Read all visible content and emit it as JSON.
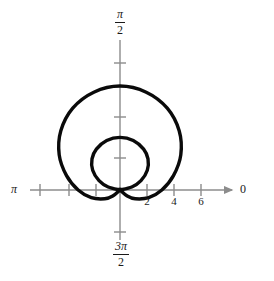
{
  "figure": {
    "title": "",
    "type": "polar-plot",
    "background_color": "#ffffff",
    "curve_color": "#0a0a0a",
    "axis_color": "#8c8c8c",
    "label_color": "#1a1a1a"
  },
  "labels": {
    "right_axis": "0",
    "left_axis": "π",
    "top_axis_numerator": "π",
    "top_axis_denominator": "2",
    "bottom_axis_numerator": "3π",
    "bottom_axis_denominator": "2"
  },
  "chart_data": {
    "type": "line",
    "title": "",
    "subtitle": "",
    "xlabel": "",
    "ylabel": "",
    "grid": false,
    "legend": null,
    "coordinate_system": "polar",
    "angle_axis_labels": [
      "0",
      "π/2",
      "π",
      "3π/2"
    ],
    "radial_tick_labels": [
      "2",
      "4",
      "6"
    ],
    "radial_tick_values": [
      2,
      4,
      6
    ],
    "xlim": [
      -6.6,
      7.4
    ],
    "ylim": [
      -5.2,
      7.4
    ],
    "origin_px": [
      120,
      190
    ],
    "pixels_per_unit": 13.5,
    "annotations": [],
    "series": [
      {
        "name": "limacon-outer-loop",
        "description": "Outer loop of the limaçon passing through the pole",
        "closed": true,
        "points_polar_deg": [
          [
            90,
            7.7
          ],
          [
            75,
            7.5
          ],
          [
            60,
            7.0
          ],
          [
            45,
            6.2
          ],
          [
            30,
            5.2
          ],
          [
            15,
            4.1
          ],
          [
            0,
            3.1
          ],
          [
            -15,
            2.2
          ],
          [
            -30,
            1.3
          ],
          [
            -40,
            0.7
          ],
          [
            -48,
            0.0
          ],
          [
            -132,
            0.0
          ],
          [
            -140,
            0.7
          ],
          [
            -150,
            1.3
          ],
          [
            -165,
            2.2
          ],
          [
            180,
            3.1
          ],
          [
            165,
            4.1
          ],
          [
            150,
            5.2
          ],
          [
            135,
            6.2
          ],
          [
            120,
            7.0
          ],
          [
            105,
            7.5
          ]
        ]
      },
      {
        "name": "limacon-inner-loop",
        "description": "Inner loop of the limaçon passing through the pole",
        "closed": true,
        "points_polar_deg": [
          [
            90,
            3.9
          ],
          [
            75,
            3.8
          ],
          [
            60,
            3.5
          ],
          [
            48,
            3.1
          ],
          [
            36,
            2.5
          ],
          [
            24,
            1.7
          ],
          [
            14,
            0.9
          ],
          [
            8,
            0.0
          ],
          [
            172,
            0.0
          ],
          [
            166,
            0.9
          ],
          [
            156,
            1.7
          ],
          [
            144,
            2.5
          ],
          [
            132,
            3.1
          ],
          [
            120,
            3.5
          ],
          [
            105,
            3.8
          ]
        ]
      }
    ]
  },
  "ticks": {
    "x_positive": [
      {
        "label": "2",
        "x_px": 147
      },
      {
        "label": "4",
        "x_px": 174
      },
      {
        "label": "6",
        "x_px": 201
      }
    ],
    "x_negative_px": [
      40,
      69,
      96
    ],
    "y_px": [
      63,
      117,
      158,
      232
    ]
  }
}
